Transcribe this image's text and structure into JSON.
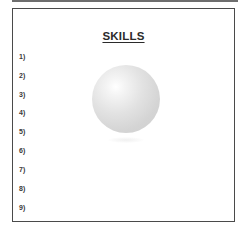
{
  "document": {
    "title": "SKILLS",
    "items": [
      {
        "label": "1)",
        "value": ""
      },
      {
        "label": "2)",
        "value": ""
      },
      {
        "label": "3)",
        "value": ""
      },
      {
        "label": "4)",
        "value": ""
      },
      {
        "label": "5)",
        "value": ""
      },
      {
        "label": "6)",
        "value": ""
      },
      {
        "label": "7)",
        "value": ""
      },
      {
        "label": "8)",
        "value": ""
      },
      {
        "label": "9)",
        "value": ""
      }
    ],
    "graphic": "sphere-image",
    "colors": {
      "border": "#4a4a4a",
      "text": "#2b2b2b",
      "sphere": "#d4d4d4"
    }
  }
}
